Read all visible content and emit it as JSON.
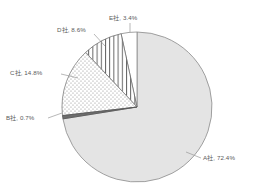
{
  "chart_data": {
    "type": "pie",
    "title": "",
    "subtitle": "",
    "xlabel": "",
    "ylabel": "",
    "legend": "none",
    "grid": false,
    "start_angle_deg": 90,
    "direction": "clockwise",
    "categories": [
      "A社",
      "B社",
      "C社",
      "D社",
      "E社"
    ],
    "values": [
      72.4,
      0.7,
      14.8,
      8.6,
      3.4
    ],
    "value_unit": "%",
    "slices": [
      {
        "name": "A社",
        "value": 72.4,
        "label": "A社, 72.4%",
        "fill": "#e4e4e4",
        "pattern": "solid-light-gray",
        "stroke": "#8a8a8a"
      },
      {
        "name": "B社",
        "value": 0.7,
        "label": "B社, 0.7%",
        "fill": "#6e6e6e",
        "pattern": "solid-dark-gray",
        "stroke": "#555555"
      },
      {
        "name": "C社",
        "value": 14.8,
        "label": "C社, 14.8%",
        "fill": "#ffffff",
        "pattern": "dotted",
        "stroke": "#7d7d7d"
      },
      {
        "name": "D社",
        "value": 8.6,
        "label": "D社, 8.6%",
        "fill": "#ffffff",
        "pattern": "vertical-lines",
        "stroke": "#6d6d6d"
      },
      {
        "name": "E社",
        "value": 3.4,
        "label": "E社, 3.4%",
        "fill": "#ffffff",
        "pattern": "blank",
        "stroke": "#8a8a8a"
      }
    ],
    "labels": {
      "a": "A社, 72.4%",
      "b": "B社, 0.7%",
      "c": "C社, 14.8%",
      "d": "D社, 8.6%",
      "e": "E社, 3.4%"
    },
    "geometry": {
      "center_x": 137,
      "center_y": 107,
      "radius": 75
    },
    "colors": {
      "background": "#ffffff",
      "label_text": "#5a5a5a",
      "leader_line": "#9a9a9a",
      "outline": "#8a8a8a"
    }
  }
}
